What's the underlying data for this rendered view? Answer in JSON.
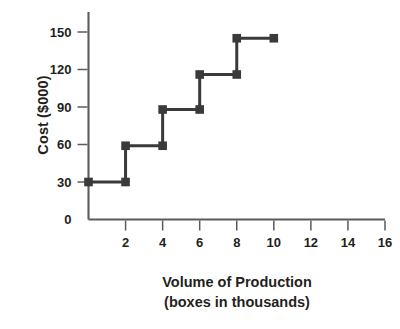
{
  "chart_data": {
    "type": "line",
    "subtype": "step",
    "title": "",
    "xlabel": "Volume of Production (boxes in thousands)",
    "ylabel": "Cost ($000)",
    "xlim": [
      0,
      16
    ],
    "ylim": [
      0,
      160
    ],
    "grid": false,
    "legend": null,
    "x_ticks": [
      2,
      4,
      6,
      8,
      10,
      12,
      14,
      16
    ],
    "x_tick_labels": [
      "2",
      "4",
      "6",
      "8",
      "10",
      "12",
      "14",
      "16"
    ],
    "y_ticks": [
      0,
      30,
      60,
      90,
      120,
      150
    ],
    "y_tick_labels": [
      "0",
      "30",
      "60",
      "90",
      "120",
      "150"
    ],
    "series": [
      {
        "name": "Cost",
        "color": "#3a3a3a",
        "marker": "square",
        "steps": [
          {
            "x_start": 0,
            "x_end": 2,
            "y": 30
          },
          {
            "x_start": 2,
            "x_end": 4,
            "y": 59
          },
          {
            "x_start": 4,
            "x_end": 6,
            "y": 88
          },
          {
            "x_start": 6,
            "x_end": 8,
            "y": 116
          },
          {
            "x_start": 8,
            "x_end": 10,
            "y": 145
          }
        ],
        "points": [
          {
            "x": 0,
            "y": 30
          },
          {
            "x": 2,
            "y": 30
          },
          {
            "x": 2,
            "y": 59
          },
          {
            "x": 4,
            "y": 59
          },
          {
            "x": 4,
            "y": 88
          },
          {
            "x": 6,
            "y": 88
          },
          {
            "x": 6,
            "y": 116
          },
          {
            "x": 8,
            "y": 116
          },
          {
            "x": 8,
            "y": 145
          },
          {
            "x": 10,
            "y": 145
          }
        ],
        "markers": [
          {
            "x": 0,
            "y": 30
          },
          {
            "x": 2,
            "y": 30
          },
          {
            "x": 2,
            "y": 59
          },
          {
            "x": 4,
            "y": 59
          },
          {
            "x": 4,
            "y": 88
          },
          {
            "x": 6,
            "y": 88
          },
          {
            "x": 6,
            "y": 116
          },
          {
            "x": 8,
            "y": 116
          },
          {
            "x": 8,
            "y": 145
          },
          {
            "x": 10,
            "y": 145
          }
        ]
      }
    ]
  },
  "axes": {
    "y_title": "Cost ($000)",
    "x_title_line1": "Volume of Production",
    "x_title_line2": "(boxes in thousands)"
  },
  "colors": {
    "series": "#3a3a3a",
    "axis": "#5b5b5b",
    "text": "#231f20",
    "background": "#ffffff"
  }
}
